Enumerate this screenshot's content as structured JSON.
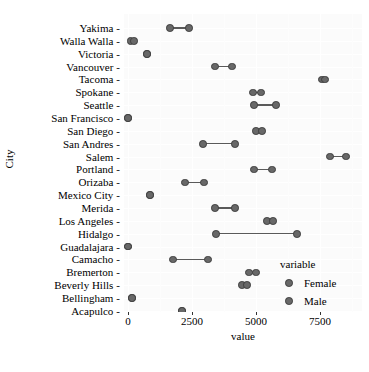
{
  "axes": {
    "y_title": "City",
    "x_title": "value",
    "x_ticks": [
      0,
      2500,
      5000,
      7500
    ],
    "x_tick_labels": [
      "0",
      "2500",
      "5000",
      "7500"
    ]
  },
  "legend": {
    "title": "variable",
    "items": [
      {
        "label": "Female",
        "color": "#686868",
        "icon": "dot-icon"
      },
      {
        "label": "Male",
        "color": "#686868",
        "icon": "dot-icon"
      }
    ]
  },
  "chart_data": {
    "type": "scatter",
    "title": "",
    "xlabel": "value",
    "ylabel": "City",
    "xlim": [
      -250,
      9000
    ],
    "grid": true,
    "legend_position": "right",
    "series": [
      {
        "name": "Female",
        "color": "#686868"
      },
      {
        "name": "Male",
        "color": "#686868"
      }
    ],
    "categories": [
      "Yakima",
      "Walla Walla",
      "Victoria",
      "Vancouver",
      "Tacoma",
      "Spokane",
      "Seattle",
      "San Francisco",
      "San Diego",
      "San Andres",
      "Salem",
      "Portland",
      "Orizaba",
      "Mexico City",
      "Merida",
      "Los Angeles",
      "Hidalgo",
      "Guadalajara",
      "Camacho",
      "Bremerton",
      "Beverly Hills",
      "Bellingham",
      "Acapulco"
    ],
    "points": [
      {
        "city": "Yakima",
        "Female": 1640,
        "Male": 2380
      },
      {
        "city": "Walla Walla",
        "Female": 100,
        "Male": 230
      },
      {
        "city": "Victoria",
        "Female": 740,
        "Male": 740
      },
      {
        "city": "Vancouver",
        "Female": 3400,
        "Male": 4060
      },
      {
        "city": "Tacoma",
        "Female": 7580,
        "Male": 7700
      },
      {
        "city": "Spokane",
        "Female": 4880,
        "Male": 5190
      },
      {
        "city": "Seattle",
        "Female": 4920,
        "Male": 5780
      },
      {
        "city": "San Francisco",
        "Female": 0,
        "Male": 0
      },
      {
        "city": "San Diego",
        "Female": 5000,
        "Male": 5230
      },
      {
        "city": "San Andres",
        "Female": 2930,
        "Male": 4180
      },
      {
        "city": "Salem",
        "Female": 7890,
        "Male": 8510
      },
      {
        "city": "Portland",
        "Female": 4920,
        "Male": 5620
      },
      {
        "city": "Orizaba",
        "Female": 2230,
        "Male": 2970
      },
      {
        "city": "Mexico City",
        "Female": 860,
        "Male": 860
      },
      {
        "city": "Merida",
        "Female": 3400,
        "Male": 4180
      },
      {
        "city": "Los Angeles",
        "Female": 5430,
        "Male": 5660
      },
      {
        "city": "Hidalgo",
        "Female": 3440,
        "Male": 6600
      },
      {
        "city": "Guadalajara",
        "Female": 0,
        "Male": 0
      },
      {
        "city": "Camacho",
        "Female": 1760,
        "Male": 3130
      },
      {
        "city": "Bremerton",
        "Female": 4730,
        "Male": 5000
      },
      {
        "city": "Beverly Hills",
        "Female": 4450,
        "Male": 4650
      },
      {
        "city": "Bellingham",
        "Female": 160,
        "Male": 160
      },
      {
        "city": "Acapulco",
        "Female": 2110,
        "Male": 2110
      }
    ]
  }
}
